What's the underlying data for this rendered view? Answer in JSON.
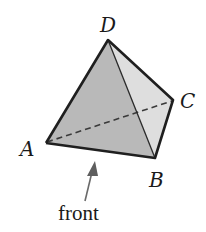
{
  "figure": {
    "vertices": {
      "A": {
        "label": "A",
        "x": 46,
        "y": 143
      },
      "B": {
        "label": "B",
        "x": 155,
        "y": 158
      },
      "C": {
        "label": "C",
        "x": 173,
        "y": 100
      },
      "D": {
        "label": "D",
        "x": 108,
        "y": 40
      }
    },
    "hidden_edge": "AC",
    "visible_edges": [
      "AB",
      "BC",
      "CD",
      "DA",
      "DB"
    ],
    "faces": {
      "front": {
        "vertices": [
          "A",
          "B",
          "D"
        ],
        "color": "#b9b9b9"
      },
      "right": {
        "vertices": [
          "B",
          "C",
          "D"
        ],
        "color": "#dedede"
      }
    },
    "arrow": {
      "label": "front",
      "color": "#6a6a6a",
      "tip": {
        "x": 95,
        "y": 161
      },
      "tail": {
        "x": 85,
        "y": 201
      }
    },
    "colors": {
      "edge": "#1f1f1f",
      "dashed_edge": "#3a3a3a",
      "background": "#ffffff"
    }
  }
}
